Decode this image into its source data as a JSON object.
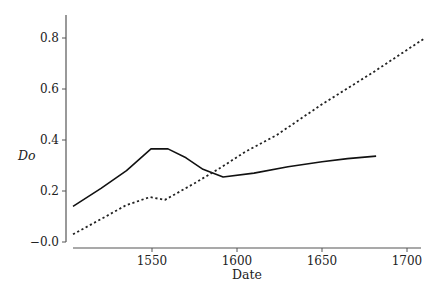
{
  "chart_data": {
    "type": "line",
    "title": "",
    "xlabel": "Date",
    "ylabel": "Do",
    "xlim": [
      1503,
      1711
    ],
    "ylim": [
      0.0,
      0.88
    ],
    "xticks": [
      1550,
      1600,
      1650,
      1700
    ],
    "xtick_labels": [
      "1550",
      "1600",
      "1650",
      "1700"
    ],
    "yticks": [
      0.0,
      0.2,
      0.4,
      0.6,
      0.8
    ],
    "ytick_labels": [
      "−0.0",
      "0.2",
      "0.4",
      "0.6",
      "0.8"
    ],
    "grid": false,
    "legend": null,
    "series": [
      {
        "name": "solid",
        "style": "solid",
        "color": "#111111",
        "x": [
          1503.5,
          1520,
          1535,
          1549.4,
          1559.4,
          1570,
          1580,
          1591.8,
          1610,
          1630,
          1650,
          1665,
          1681.8
        ],
        "y": [
          0.14,
          0.21,
          0.28,
          0.365,
          0.365,
          0.33,
          0.285,
          0.255,
          0.27,
          0.295,
          0.315,
          0.327,
          0.337
        ]
      },
      {
        "name": "dashed",
        "style": "dotted",
        "color": "#222222",
        "x": [
          1503.5,
          1520,
          1535,
          1548.8,
          1557.6,
          1575,
          1590,
          1604.7,
          1623.5,
          1650,
          1680,
          1710.6
        ],
        "y": [
          0.03,
          0.09,
          0.145,
          0.176,
          0.165,
          0.23,
          0.29,
          0.353,
          0.42,
          0.54,
          0.665,
          0.8
        ]
      }
    ]
  },
  "layout": {
    "plot": {
      "x0": 73,
      "x1": 421,
      "y_axis_x": 66,
      "x_axis_y": 248,
      "y_top": 15
    },
    "xmap": {
      "v0": 1550,
      "px0": 152,
      "px_per_unit": 1.7
    },
    "ymap": {
      "v0": 0.0,
      "px0": 242,
      "px_per_unit": 255
    }
  }
}
